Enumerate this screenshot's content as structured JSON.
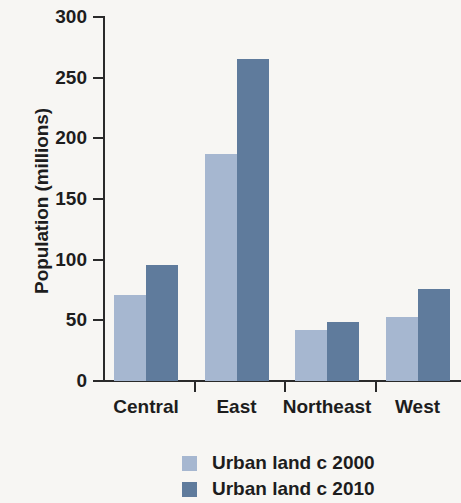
{
  "chart_data": {
    "type": "bar",
    "title": "",
    "subtitle": "",
    "xlabel": "",
    "ylabel": "Population (millions)",
    "categories": [
      "Central",
      "East",
      "Northeast",
      "West"
    ],
    "series": [
      {
        "name": "Urban land c 2000",
        "color": "#a6b7d0",
        "values": [
          71,
          187,
          42,
          53
        ]
      },
      {
        "name": "Urban land c 2010",
        "color": "#5f7b9c",
        "values": [
          96,
          265,
          49,
          76
        ]
      }
    ],
    "ylim": [
      0,
      300
    ],
    "yticks": [
      0,
      50,
      100,
      150,
      200,
      250,
      300
    ],
    "ytick_labels": [
      "0",
      "50",
      "100",
      "150",
      "200",
      "250",
      "300"
    ],
    "grid": false,
    "legend_position": "bottom-center",
    "background_color": "#f7f6f3",
    "axis_color": "#2a2a2a"
  }
}
